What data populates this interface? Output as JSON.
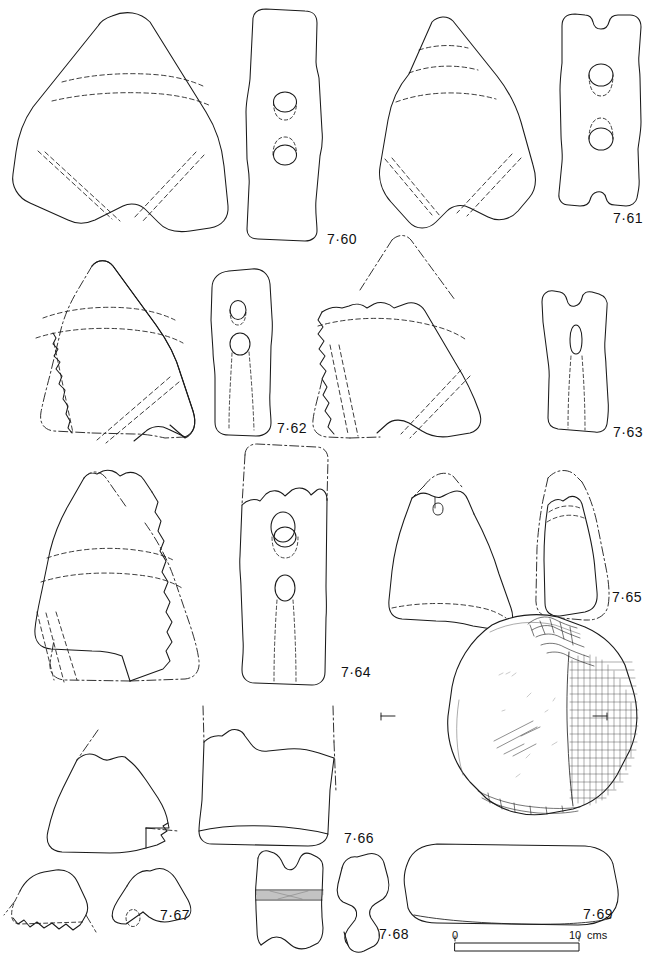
{
  "plate": {
    "title": "Plate 7 — Stone battle-axes, axe-hammers and rubbers",
    "background_color": "#ffffff",
    "ink_color": "#1a1a1a",
    "figure_count": 10
  },
  "figures": [
    {
      "id": "7-60",
      "label": "7·60",
      "object_type": "stone-battle-axe",
      "views": [
        "face",
        "profile-section"
      ],
      "notes": "Complete triangular battle-axe, face view with dashed facet lines; narrow profile with two drilled hour-glass perforations."
    },
    {
      "id": "7-61",
      "label": "7·61",
      "object_type": "stone-battle-axe",
      "views": [
        "face",
        "profile-section"
      ],
      "notes": "Triangular battle-axe with dashed facet bands near butt; profile has notched top and two perforations."
    },
    {
      "id": "7-62",
      "label": "7·62",
      "object_type": "stone-battle-axe-fragment",
      "views": [
        "face",
        "profile-section"
      ],
      "notes": "Broken battle-axe, reconstructed outline shown as dash-dot; profile with small upper and larger lower perforation."
    },
    {
      "id": "7-63",
      "label": "7·63",
      "object_type": "stone-battle-axe-fragment",
      "views": [
        "face",
        "profile-section"
      ],
      "notes": "Large fragment with reconstructed butt in dash-dot; profile shows a tapering drilled perforation."
    },
    {
      "id": "7-64",
      "label": "7·64",
      "object_type": "stone-battle-axe-fragment",
      "views": [
        "face",
        "profile-section"
      ],
      "notes": "Fragment of battle-axe with dashed reconstruction; profile with two perforations."
    },
    {
      "id": "7-65",
      "label": "7·65",
      "object_type": "stone-axe-fragment",
      "views": [
        "face",
        "profile-section"
      ],
      "notes": "Two fragments drawn side by side with dash-dot reconstructed outlines; small perforation stub visible."
    },
    {
      "id": "7-66",
      "label": "7·66",
      "object_type": "stone-axe-fragment",
      "views": [
        "face"
      ],
      "notes": "Rectangular fragment with dash-dot reconstruction lines at top and right."
    },
    {
      "id": "7-67",
      "label": "7·67",
      "object_type": "stone-axe-fragment",
      "views": [
        "face",
        "profile",
        "section"
      ],
      "notes": "Fragment with dash-dot reconstruction; two smaller profiles beneath, one with a small perforation."
    },
    {
      "id": "7-68",
      "label": "7·68",
      "object_type": "stone-implement-fragment",
      "views": [
        "face",
        "profile"
      ],
      "notes": "Small elongated fragment with a shaded horizontal band, plus an irregular side profile."
    },
    {
      "id": "7-69",
      "label": "7·69",
      "object_type": "stone-rubber",
      "views": [
        "plan",
        "section"
      ],
      "notes": "Ovoid rubber/quern stone, plan view with cross-hatched pecked working edge and section-level tick marks; long rounded rectangular section below."
    }
  ],
  "scale_bar": {
    "start_label": "0",
    "end_label": "10",
    "unit_label": "cms",
    "length_cm": 10,
    "pixel_length": 124
  }
}
